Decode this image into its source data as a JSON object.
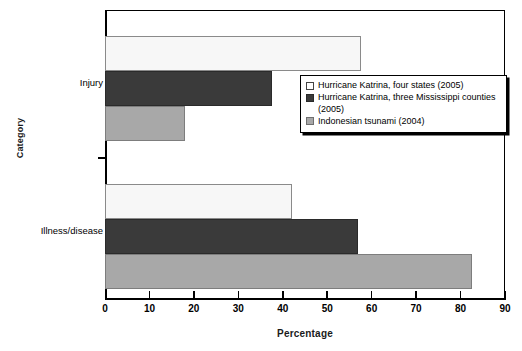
{
  "chart_data": {
    "type": "bar",
    "orientation": "horizontal",
    "title": "",
    "xlabel": "Percentage",
    "ylabel": "Category",
    "categories": [
      "Injury",
      "Illness/disease"
    ],
    "xlim": [
      0,
      90
    ],
    "xticks": [
      0,
      10,
      20,
      30,
      40,
      50,
      60,
      70,
      80,
      90
    ],
    "grid": false,
    "legend_position": "middle-right",
    "series": [
      {
        "name": "Hurricane Katrina, four states (2005)",
        "color": "#f7f7f7",
        "values": [
          57.5,
          42.0
        ]
      },
      {
        "name": "Hurricane Katrina, three Mississippi counties (2005)",
        "color": "#3a3a3a",
        "values": [
          37.5,
          57.0
        ]
      },
      {
        "name": "Indonesian tsunami (2004)",
        "color": "#a8a8a8",
        "values": [
          18.0,
          82.5
        ]
      }
    ]
  },
  "axes": {
    "x_title": "Percentage",
    "y_title": "Category",
    "x_tick_labels": [
      "0",
      "10",
      "20",
      "30",
      "40",
      "50",
      "60",
      "70",
      "80",
      "90"
    ],
    "y_tick_labels": [
      "Injury",
      "Illness/disease"
    ]
  },
  "legend": {
    "entries": [
      {
        "label": "Hurricane Katrina, four states (2005)",
        "swatch": "white-swatch"
      },
      {
        "label": "Hurricane Katrina, three Mississippi counties (2005)",
        "swatch": "dark-swatch"
      },
      {
        "label": "Indonesian tsunami (2004)",
        "swatch": "gray-swatch"
      }
    ]
  }
}
